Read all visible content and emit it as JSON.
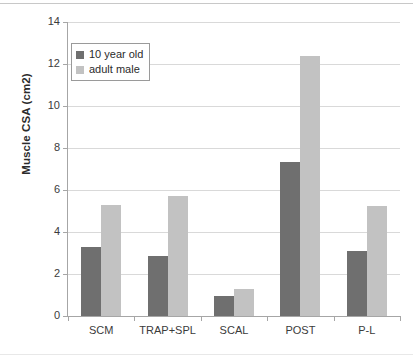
{
  "chart_data": {
    "type": "bar",
    "title": "",
    "xlabel": "",
    "ylabel": "Muscle CSA (cm2)",
    "categories": [
      "SCM",
      "TRAP+SPL",
      "SCAL",
      "POST",
      "P-L"
    ],
    "series": [
      {
        "name": "10 year old",
        "color": "#6f6f6f",
        "values": [
          3.3,
          2.85,
          0.95,
          7.35,
          3.1
        ]
      },
      {
        "name": "adult male",
        "color": "#c2c2c2",
        "values": [
          5.3,
          5.7,
          1.3,
          12.4,
          5.25
        ]
      }
    ],
    "ylim": [
      0,
      14
    ],
    "yticks": [
      0,
      2,
      4,
      6,
      8,
      10,
      12,
      14
    ],
    "ytick_labels": [
      "0",
      "2",
      "4",
      "6",
      "8",
      "10",
      "12",
      "14"
    ],
    "grid": true,
    "legend_position": "upper-left"
  },
  "legend": {
    "entries": [
      {
        "label": "10 year old",
        "swatch": "dark-gray-swatch"
      },
      {
        "label": "adult male",
        "swatch": "light-gray-swatch"
      }
    ]
  }
}
